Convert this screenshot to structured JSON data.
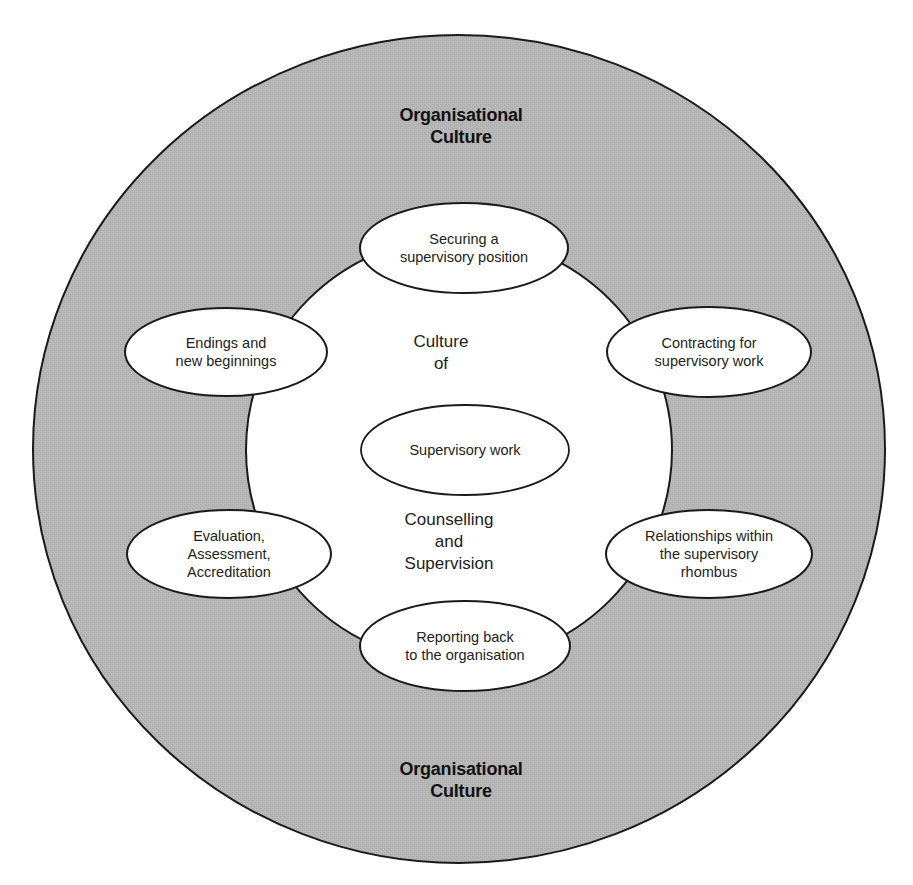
{
  "diagram": {
    "outer_ring": {
      "label_top": "Organisational\nCulture",
      "label_bottom": "Organisational\nCulture",
      "fill": "#b5b5b5",
      "stroke": "#1a1a1a"
    },
    "inner_circle": {
      "label_upper": "Culture\nof",
      "label_lower": "Counselling\nand\nSupervision",
      "fill": "#ffffff",
      "stroke": "#1a1a1a"
    },
    "center_node": {
      "label": "Supervisory work"
    },
    "ring_nodes": [
      {
        "id": "securing",
        "label": "Securing a\nsupervisory position",
        "position": "top"
      },
      {
        "id": "contracting",
        "label": "Contracting for\nsupervisory work",
        "position": "upper-right"
      },
      {
        "id": "relationships",
        "label": "Relationships within\nthe supervisory\nrhombus",
        "position": "lower-right"
      },
      {
        "id": "reporting",
        "label": "Reporting back\nto the organisation",
        "position": "bottom"
      },
      {
        "id": "evaluation",
        "label": "Evaluation,\nAssessment,\nAccreditation",
        "position": "lower-left"
      },
      {
        "id": "endings",
        "label": "Endings and\nnew beginnings",
        "position": "upper-left"
      }
    ]
  }
}
